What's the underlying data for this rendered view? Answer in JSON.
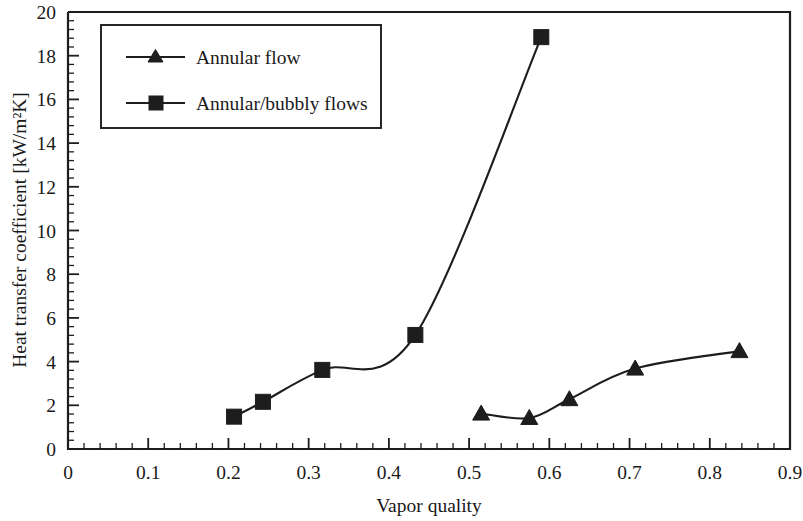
{
  "chart_data": {
    "type": "line",
    "title": "",
    "xlabel": "Vapor quality",
    "ylabel": "Heat transfer coefficient [kW/m²K]",
    "xlim": [
      0,
      0.9
    ],
    "ylim": [
      0,
      20
    ],
    "x_major_ticks": [
      0,
      0.1,
      0.2,
      0.3,
      0.4,
      0.5,
      0.6,
      0.7,
      0.8,
      0.9
    ],
    "x_tick_labels": [
      "0",
      "0.1",
      "0.2",
      "0.3",
      "0.4",
      "0.5",
      "0.6",
      "0.7",
      "0.8",
      "0.9"
    ],
    "x_minor_per_major": 5,
    "y_major_ticks": [
      0,
      2,
      4,
      6,
      8,
      10,
      12,
      14,
      16,
      18,
      20
    ],
    "y_tick_labels": [
      "0",
      "2",
      "4",
      "6",
      "8",
      "10",
      "12",
      "14",
      "16",
      "18",
      "20"
    ],
    "y_minor_per_major": 5,
    "grid": false,
    "legend_position": "upper-left-inset",
    "series": [
      {
        "name": "Annular flow",
        "marker": "triangle",
        "color": "#1d1d1d",
        "points": [
          {
            "x": 0.515,
            "y": 1.62
          },
          {
            "x": 0.575,
            "y": 1.42
          },
          {
            "x": 0.625,
            "y": 2.28
          },
          {
            "x": 0.707,
            "y": 3.68
          },
          {
            "x": 0.837,
            "y": 4.48
          }
        ]
      },
      {
        "name": "Annular/bubbly flows",
        "marker": "square",
        "color": "#1d1d1d",
        "points": [
          {
            "x": 0.207,
            "y": 1.48
          },
          {
            "x": 0.243,
            "y": 2.16
          },
          {
            "x": 0.317,
            "y": 3.62
          },
          {
            "x": 0.433,
            "y": 5.22
          },
          {
            "x": 0.59,
            "y": 18.85
          }
        ]
      }
    ]
  },
  "legend": {
    "entries": [
      {
        "label": "Annular flow",
        "marker": "triangle"
      },
      {
        "label": "Annular/bubbly flows",
        "marker": "square"
      }
    ]
  }
}
